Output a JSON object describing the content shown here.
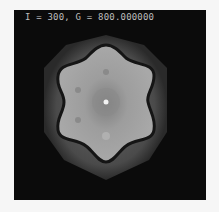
{
  "simulation": {
    "label": "I = 300, G = 800.000000",
    "iteration": 300,
    "G": "800.000000",
    "symmetry": "six-fold hexagonal",
    "colors": {
      "background": "#0b0b0b",
      "outer_halo": "#4a4a4a",
      "inner_region": "#9a9a9a",
      "boundary": "#141414",
      "center_spot": "#f2f2f2"
    }
  }
}
